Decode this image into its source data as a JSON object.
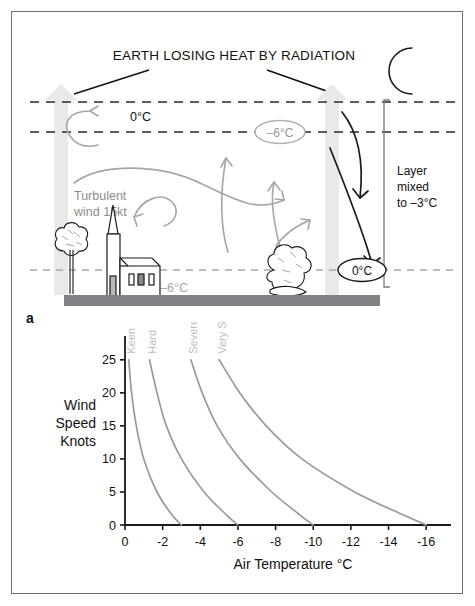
{
  "figure": {
    "panels": [
      {
        "letter": "a",
        "name": "radiation-inversion-diagram"
      },
      {
        "letter": "b",
        "name": "frost-severity-chart"
      }
    ]
  },
  "panel_a": {
    "title": "EARTH LOSING HEAT BY RADIATION",
    "labels": {
      "top_temp": "0°C",
      "mid_temp": "–6°C",
      "surface_temp": "–6°C",
      "mixed_surface_temp": "0°C",
      "wind": "Turbulent\nwind 15kt",
      "wind_line1": "Turbulent",
      "wind_line2": "wind 15kt",
      "layer_line1": "Layer",
      "layer_line2": "mixed",
      "layer_line3": "to –3°C"
    },
    "icons": {
      "moon": "crescent-moon-icon",
      "church": "church-icon",
      "tree": "tree-icon",
      "bush": "bush-icon",
      "updraft_arrow": "up-arrow-icon",
      "downdraft_arrow": "down-arrow-icon"
    },
    "colors": {
      "ground": "#808285",
      "big_arrow": "#e8e8e8",
      "gray_ink": "#9a9a9a",
      "black_ink": "#1a1a1a"
    }
  },
  "chart_data": {
    "type": "line",
    "title": "",
    "xlabel": "Air Temperature °C",
    "ylabel": "Wind Speed Knots",
    "ylabel_lines": [
      "Wind",
      "Speed",
      "Knots"
    ],
    "xlim": [
      0,
      -17
    ],
    "ylim": [
      0,
      28
    ],
    "xticks": [
      0,
      -2,
      -4,
      -6,
      -8,
      -10,
      -12,
      -14,
      -16
    ],
    "xticklabels": [
      "0",
      "-2",
      "-4",
      "-6",
      "-8",
      "-10",
      "-12",
      "-14",
      "-16"
    ],
    "yticks": [
      0,
      5,
      10,
      15,
      20,
      25
    ],
    "yticklabels": [
      "0",
      "5",
      "10",
      "15",
      "20",
      "25"
    ],
    "grid": false,
    "legend": "inline-curve-labels",
    "line_color": "#9a9a9a",
    "series": [
      {
        "name": "Keen",
        "label": "Keen",
        "points": [
          {
            "x": -0.2,
            "y": 25.0
          },
          {
            "x": -0.35,
            "y": 20.0
          },
          {
            "x": -0.6,
            "y": 15.0
          },
          {
            "x": -1.0,
            "y": 10.0
          },
          {
            "x": -1.7,
            "y": 5.0
          },
          {
            "x": -2.5,
            "y": 1.5
          },
          {
            "x": -3.0,
            "y": 0.0
          }
        ]
      },
      {
        "name": "Hard",
        "label": "Hard",
        "points": [
          {
            "x": -1.3,
            "y": 25.0
          },
          {
            "x": -1.7,
            "y": 20.0
          },
          {
            "x": -2.2,
            "y": 15.0
          },
          {
            "x": -3.0,
            "y": 10.0
          },
          {
            "x": -4.2,
            "y": 5.0
          },
          {
            "x": -5.4,
            "y": 1.5
          },
          {
            "x": -6.0,
            "y": 0.0
          }
        ]
      },
      {
        "name": "Severe",
        "label": "Severe",
        "points": [
          {
            "x": -3.5,
            "y": 25.0
          },
          {
            "x": -4.1,
            "y": 20.0
          },
          {
            "x": -4.9,
            "y": 15.0
          },
          {
            "x": -6.1,
            "y": 10.0
          },
          {
            "x": -7.8,
            "y": 5.0
          },
          {
            "x": -9.3,
            "y": 1.5
          },
          {
            "x": -10.0,
            "y": 0.0
          }
        ]
      },
      {
        "name": "Very Severe",
        "label": "Very Severe",
        "points": [
          {
            "x": -5.0,
            "y": 25.0
          },
          {
            "x": -6.1,
            "y": 20.0
          },
          {
            "x": -7.5,
            "y": 15.0
          },
          {
            "x": -9.4,
            "y": 10.0
          },
          {
            "x": -12.2,
            "y": 5.0
          },
          {
            "x": -14.8,
            "y": 1.5
          },
          {
            "x": -16.0,
            "y": 0.0
          }
        ]
      }
    ]
  }
}
